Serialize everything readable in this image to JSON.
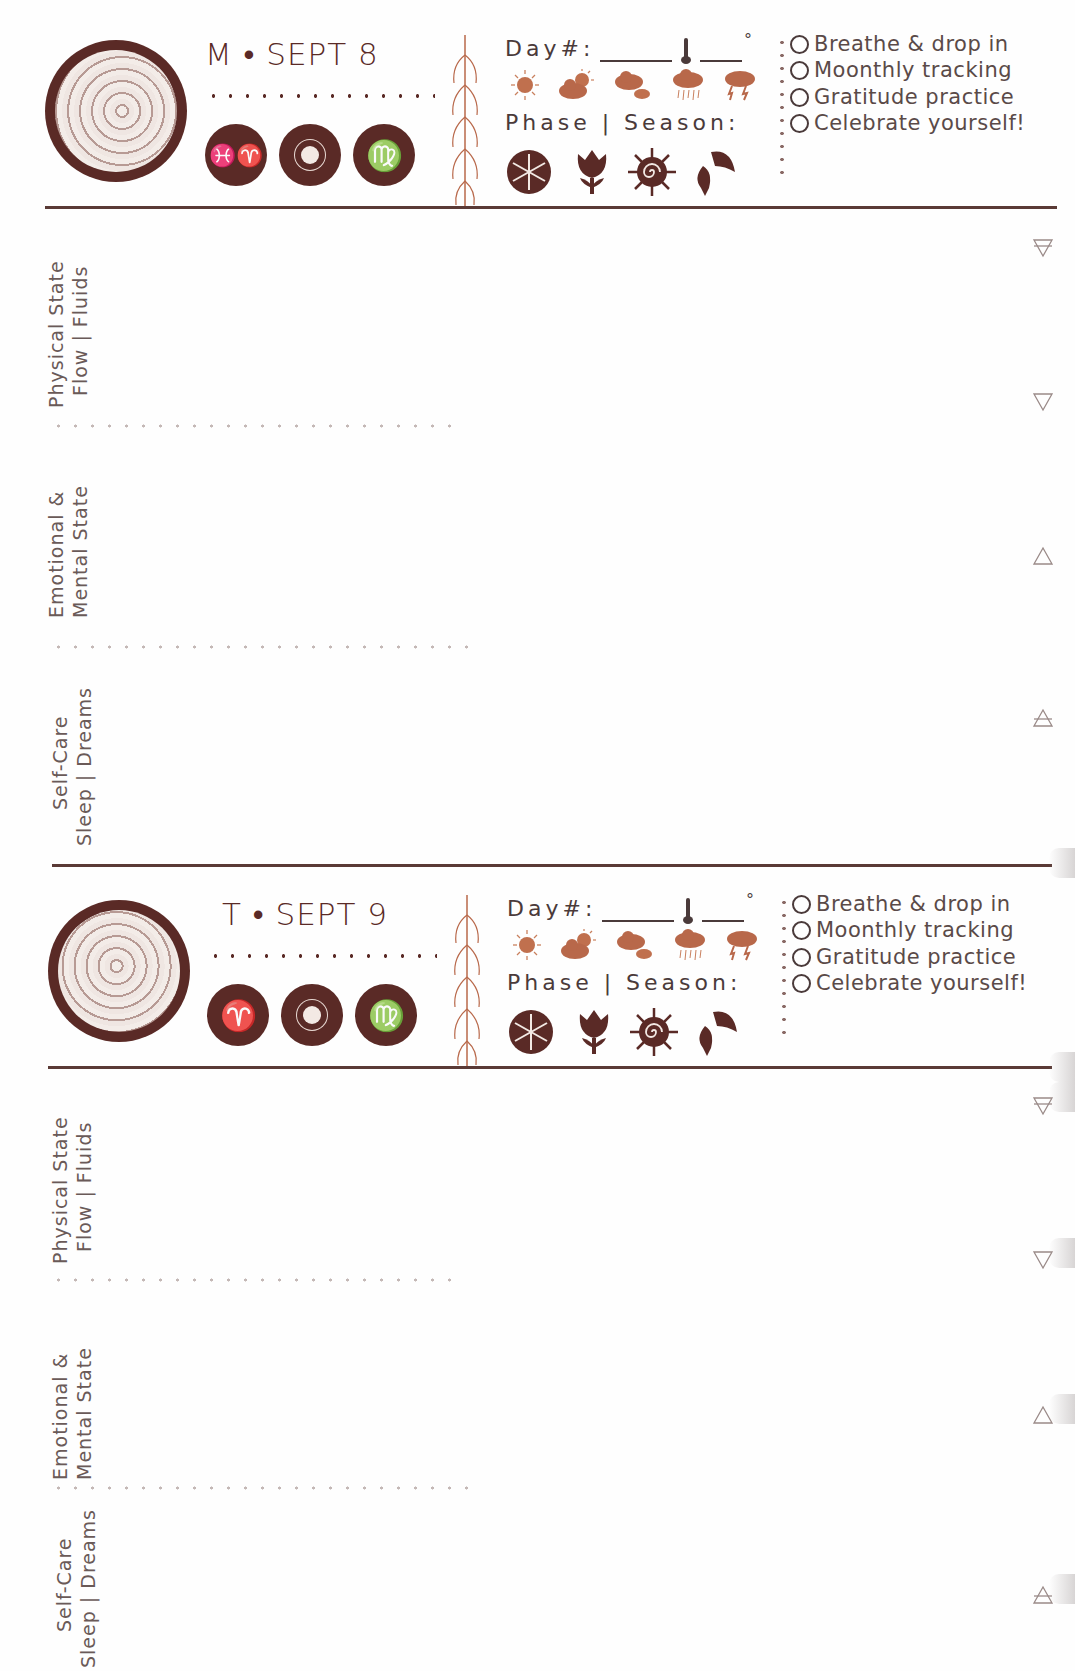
{
  "planner": {
    "colors": {
      "primary": "#5a2a26",
      "weather": "#b8684a",
      "text": "#5a4a48",
      "dots": "#c4b8b6"
    },
    "fields": {
      "day_label": "Day#:",
      "phase_label": "Phase | Season:",
      "degree_symbol": "°"
    },
    "weather_icons": [
      "sunny-icon",
      "partly-cloudy-icon",
      "cloudy-icon",
      "rain-icon",
      "storm-icon"
    ],
    "season_icons": [
      "winter-snowflake-icon",
      "spring-tulip-icon",
      "summer-sun-icon",
      "autumn-leaf-icon"
    ],
    "checklist": [
      "Breathe & drop in",
      "Moonthly tracking",
      "Gratitude practice",
      "Celebrate yourself!"
    ],
    "sections": [
      {
        "line1": "Physical State",
        "line2": "Flow | Fluids",
        "element_icon": "earth-element-icon"
      },
      {
        "line1": "Emotional &",
        "line2": "Mental State",
        "element_icon": "water-element-icon"
      },
      {
        "line1": "Self-Care",
        "line2": "Sleep | Dreams",
        "element_icon": "fire-element-icon"
      }
    ],
    "entries": [
      {
        "date": "M • SEPT 8",
        "signs": [
          "♓♈",
          "☀",
          "♍"
        ],
        "sign_names": [
          "pisces-aries-icon",
          "sun-icon",
          "virgo-icon"
        ],
        "element_icons": [
          "earth-element-icon",
          "water-element-icon",
          "fire-element-icon",
          "air-element-icon"
        ]
      },
      {
        "date": "T • SEPT 9",
        "signs": [
          "♈",
          "☀",
          "♍"
        ],
        "sign_names": [
          "aries-icon",
          "sun-icon",
          "virgo-icon"
        ],
        "element_icons": [
          "earth-element-icon",
          "water-element-icon",
          "fire-element-icon",
          "air-element-icon"
        ]
      }
    ]
  }
}
